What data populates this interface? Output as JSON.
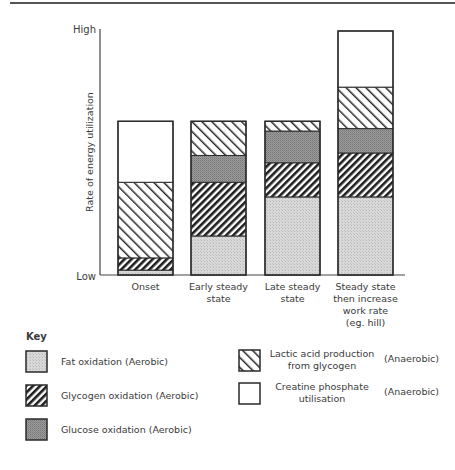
{
  "chart_data": {
    "type": "bar",
    "stacked": true,
    "title": "",
    "xlabel": "",
    "ylabel": "Rate of energy utilization",
    "y_ticks": [
      "Low",
      "High"
    ],
    "ylim": [
      0,
      100
    ],
    "categories": [
      [
        "Onset"
      ],
      [
        "Early steady",
        "state"
      ],
      [
        "Late steady",
        "state"
      ],
      [
        "Steady state",
        "then increase",
        "work rate",
        "(eg. hill)"
      ]
    ],
    "series": [
      {
        "name": "Fat oxidation",
        "type_label": "(Aerobic)",
        "pattern": "fat",
        "values": [
          2,
          16,
          32,
          32
        ]
      },
      {
        "name": "Glycogen oxidation",
        "type_label": "(Aerobic)",
        "pattern": "glycogen",
        "values": [
          5,
          22,
          14,
          18
        ]
      },
      {
        "name": "Glucose oxidation",
        "type_label": "(Aerobic)",
        "pattern": "glucose",
        "values": [
          0,
          11,
          13,
          10
        ]
      },
      {
        "name": "Lactic acid production from glycogen",
        "type_label": "(Anaerobic)",
        "pattern": "lactic",
        "values": [
          31,
          14,
          4,
          17
        ]
      },
      {
        "name": "Creatine phosphate utilisation",
        "type_label": "(Anaerobic)",
        "pattern": "creatine",
        "values": [
          25,
          0,
          0,
          23
        ]
      }
    ],
    "legend_position": "bottom",
    "grid": false
  },
  "legend": {
    "title": "Key",
    "items": [
      {
        "lines": [
          "Fat oxidation"
        ],
        "tag": "(Aerobic)",
        "pattern": "fat"
      },
      {
        "lines": [
          "Glycogen oxidation"
        ],
        "tag": "(Aerobic)",
        "pattern": "glycogen"
      },
      {
        "lines": [
          "Glucose oxidation"
        ],
        "tag": "(Aerobic)",
        "pattern": "glucose"
      },
      {
        "lines": [
          "Lactic acid production",
          "from glycogen"
        ],
        "tag": "(Anaerobic)",
        "pattern": "lactic"
      },
      {
        "lines": [
          "Creatine phosphate",
          "utilisation"
        ],
        "tag": "(Anaerobic)",
        "pattern": "creatine"
      }
    ]
  }
}
